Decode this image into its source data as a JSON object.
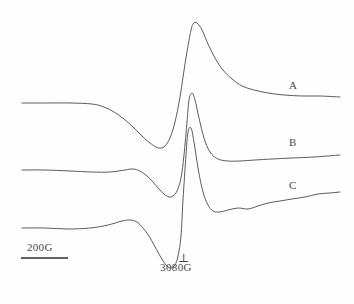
{
  "figure": {
    "type": "epr-spectra-figure",
    "background_color": "#fefefe",
    "line_color": "#4a4a4a"
  },
  "traces": [
    {
      "id": "A",
      "label": "A",
      "label_x": 289,
      "label_y": 80,
      "baseline_y": 103,
      "peak_x": 192,
      "peak_y": 23,
      "trough_x": 162,
      "trough_y": 148,
      "end_y": 97,
      "description": "broad derivative lineshape, largest amplitude"
    },
    {
      "id": "B",
      "label": "B",
      "label_x": 289,
      "label_y": 137,
      "baseline_y": 170,
      "peak_x": 188,
      "peak_y": 93,
      "trough_x": 177,
      "trough_y": 197,
      "end_y": 155,
      "description": "intermediate derivative lineshape, narrower"
    },
    {
      "id": "C",
      "label": "C",
      "label_x": 289,
      "label_y": 180,
      "baseline_y": 228,
      "peak_x": 185,
      "peak_y": 128,
      "trough_x": 172,
      "trough_y": 268,
      "end_y": 192,
      "description": "sharpest derivative lineshape, noisy right tail"
    }
  ],
  "scale_bar": {
    "label": "200G",
    "x_start": 21,
    "x_end": 68,
    "y": 258,
    "label_x": 27,
    "label_y": 242
  },
  "field_marker": {
    "symbol": "⊥",
    "label": "3080G",
    "symbol_x": 178,
    "symbol_y": 252,
    "label_x": 160,
    "label_y": 262
  },
  "chart_data": {
    "type": "line",
    "title": "",
    "xlabel": "",
    "ylabel": "",
    "grid": false,
    "legend_position": "inline-right",
    "axis_note": "magnetic field sweep, horizontal axis; scale bar = 200G; perpendicular feature marked at 3080G",
    "xlim": [
      0,
      354
    ],
    "ylim": [
      304,
      0
    ],
    "series": [
      {
        "name": "A",
        "points_x": [
          22,
          45,
          70,
          92,
          104,
          114,
          124,
          134,
          142,
          150,
          156,
          161,
          165,
          170,
          175,
          180,
          185,
          190,
          193,
          197,
          202,
          208,
          215,
          223,
          232,
          242,
          254,
          268,
          284,
          302,
          320,
          340
        ],
        "points_y": [
          103,
          103,
          103,
          104,
          107,
          112,
          119,
          128,
          136,
          143,
          147,
          148,
          146,
          138,
          122,
          97,
          64,
          35,
          24,
          23,
          30,
          44,
          58,
          70,
          79,
          86,
          90,
          93,
          95,
          96,
          96,
          97
        ]
      },
      {
        "name": "B",
        "points_x": [
          22,
          45,
          70,
          92,
          110,
          125,
          133,
          140,
          147,
          153,
          159,
          164,
          169,
          173,
          177,
          181,
          184,
          187,
          189,
          192,
          195,
          199,
          204,
          210,
          218,
          228,
          240,
          255,
          272,
          292,
          314,
          340
        ],
        "points_y": [
          170,
          170,
          171,
          172,
          172,
          170,
          169,
          171,
          176,
          182,
          189,
          194,
          197,
          196,
          191,
          178,
          155,
          122,
          100,
          93,
          100,
          118,
          138,
          152,
          159,
          161,
          161,
          160,
          159,
          158,
          157,
          155
        ]
      },
      {
        "name": "C",
        "points_x": [
          22,
          45,
          68,
          90,
          108,
          122,
          130,
          137,
          143,
          149,
          154,
          159,
          163,
          167,
          171,
          175,
          178,
          181,
          183,
          186,
          188,
          191,
          194,
          198,
          203,
          208,
          213,
          220,
          228,
          238,
          248,
          258,
          268,
          280,
          292,
          305,
          318,
          330,
          340
        ],
        "points_y": [
          228,
          228,
          229,
          228,
          225,
          221,
          220,
          222,
          228,
          236,
          245,
          254,
          261,
          266,
          268,
          265,
          256,
          236,
          200,
          155,
          132,
          128,
          142,
          168,
          192,
          205,
          211,
          212,
          210,
          208,
          209,
          206,
          203,
          201,
          199,
          197,
          194,
          193,
          192
        ]
      }
    ]
  }
}
